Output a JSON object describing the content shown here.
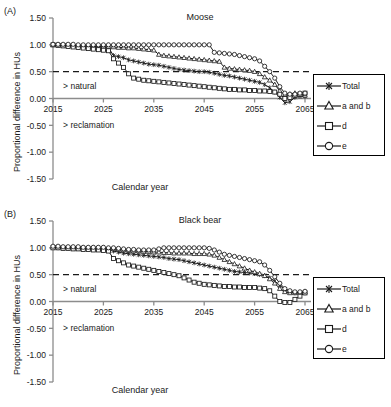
{
  "figure": {
    "background": "#ffffff",
    "axis_color": "#8c8c8c",
    "series_color": "#1a1a1a",
    "threshold_line_color": "#1a1a1a"
  },
  "panels": [
    {
      "letter": "(A)",
      "title": "Moose",
      "xlabel": "Calendar year",
      "ylabel": "Proportional difference in HUs",
      "annotation_above": "> natural",
      "annotation_below": "> reclamation"
    },
    {
      "letter": "(B)",
      "title": "Black bear",
      "xlabel": "Calendar year",
      "ylabel": "Proportional difference in HUs",
      "annotation_above": "> natural",
      "annotation_below": "> reclamation"
    }
  ],
  "legend": {
    "entries": [
      {
        "label": "Total",
        "marker": "star"
      },
      {
        "label": "a and b",
        "marker": "triangle"
      },
      {
        "label": "d",
        "marker": "square"
      },
      {
        "label": "e",
        "marker": "circle"
      }
    ]
  },
  "chart_data": [
    {
      "type": "line",
      "title": "Moose",
      "panel": "(A)",
      "xlabel": "Calendar year",
      "ylabel": "Proportional difference in HUs",
      "xlim": [
        2015,
        2065
      ],
      "ylim": [
        -1.5,
        1.5
      ],
      "xticks": [
        2015,
        2025,
        2035,
        2045,
        2055,
        2065
      ],
      "yticks": [
        -1.5,
        -1.0,
        -0.5,
        0.0,
        0.5,
        1.0,
        1.5
      ],
      "ytick_labels": [
        "-1.50",
        "-1.00",
        "-0.50",
        "0.00",
        "0.50",
        "1.00",
        "1.50"
      ],
      "grid": false,
      "legend_position": "right-outside",
      "reference_lines": [
        {
          "y": 0.5,
          "style": "dashed",
          "label": ""
        },
        {
          "y": 0.0,
          "style": "solid",
          "label": "zero axis"
        }
      ],
      "annotations": [
        {
          "text": "> natural",
          "x": 2017,
          "y": 0.18
        },
        {
          "text": "> reclamation",
          "x": 2017,
          "y": -0.55
        }
      ],
      "x": [
        2015,
        2016,
        2017,
        2018,
        2019,
        2020,
        2021,
        2022,
        2023,
        2024,
        2025,
        2026,
        2027,
        2028,
        2029,
        2030,
        2031,
        2032,
        2033,
        2034,
        2035,
        2036,
        2037,
        2038,
        2039,
        2040,
        2041,
        2042,
        2043,
        2044,
        2045,
        2046,
        2047,
        2048,
        2049,
        2050,
        2051,
        2052,
        2053,
        2054,
        2055,
        2056,
        2057,
        2058,
        2059,
        2060,
        2061,
        2062,
        2063,
        2064,
        2065
      ],
      "series": [
        {
          "name": "Total",
          "marker": "star",
          "values": [
            1.0,
            1.0,
            0.99,
            0.99,
            0.98,
            0.98,
            0.97,
            0.97,
            0.96,
            0.96,
            0.95,
            0.95,
            0.8,
            0.78,
            0.76,
            0.72,
            0.7,
            0.68,
            0.66,
            0.64,
            0.63,
            0.62,
            0.6,
            0.58,
            0.56,
            0.54,
            0.53,
            0.52,
            0.51,
            0.5,
            0.5,
            0.49,
            0.47,
            0.45,
            0.43,
            0.42,
            0.4,
            0.38,
            0.36,
            0.34,
            0.32,
            0.3,
            0.26,
            0.2,
            0.12,
            0.02,
            -0.08,
            -0.06,
            0.02,
            0.04,
            0.04
          ]
        },
        {
          "name": "a and b",
          "marker": "triangle",
          "values": [
            1.0,
            1.0,
            0.99,
            0.99,
            0.99,
            0.98,
            0.98,
            0.98,
            0.97,
            0.97,
            0.97,
            0.96,
            0.96,
            0.95,
            0.95,
            0.94,
            0.94,
            0.93,
            0.92,
            0.91,
            0.9,
            0.82,
            0.8,
            0.79,
            0.78,
            0.77,
            0.76,
            0.75,
            0.74,
            0.73,
            0.72,
            0.71,
            0.7,
            0.69,
            0.58,
            0.56,
            0.55,
            0.54,
            0.53,
            0.52,
            0.5,
            0.46,
            0.4,
            0.34,
            0.26,
            0.14,
            0.06,
            0.08,
            0.1,
            0.08,
            0.06
          ]
        },
        {
          "name": "d",
          "marker": "square",
          "values": [
            1.0,
            0.99,
            0.98,
            0.97,
            0.96,
            0.95,
            0.94,
            0.93,
            0.92,
            0.91,
            0.9,
            0.89,
            0.74,
            0.66,
            0.58,
            0.46,
            0.38,
            0.36,
            0.34,
            0.33,
            0.32,
            0.31,
            0.3,
            0.29,
            0.28,
            0.27,
            0.26,
            0.25,
            0.24,
            0.23,
            0.22,
            0.21,
            0.2,
            0.19,
            0.18,
            0.17,
            0.17,
            0.16,
            0.16,
            0.15,
            0.15,
            0.14,
            0.14,
            0.13,
            0.12,
            0.08,
            0.0,
            0.02,
            0.06,
            0.08,
            0.1
          ]
        },
        {
          "name": "e",
          "marker": "circle",
          "values": [
            1.01,
            1.01,
            1.01,
            1.01,
            1.01,
            1.0,
            1.0,
            1.0,
            1.0,
            1.0,
            1.0,
            1.0,
            1.0,
            1.0,
            1.0,
            1.0,
            1.0,
            1.0,
            1.0,
            1.0,
            1.0,
            1.0,
            1.0,
            1.0,
            1.0,
            1.0,
            1.0,
            1.0,
            1.0,
            1.0,
            1.0,
            1.0,
            0.86,
            0.85,
            0.84,
            0.83,
            0.82,
            0.8,
            0.78,
            0.76,
            0.74,
            0.7,
            0.6,
            0.5,
            0.38,
            0.22,
            0.1,
            0.08,
            0.08,
            0.1,
            0.1
          ]
        }
      ]
    },
    {
      "type": "line",
      "title": "Black bear",
      "panel": "(B)",
      "xlabel": "Calendar year",
      "ylabel": "Proportional difference in HUs",
      "xlim": [
        2015,
        2065
      ],
      "ylim": [
        -1.5,
        1.5
      ],
      "xticks": [
        2015,
        2025,
        2035,
        2045,
        2055,
        2065
      ],
      "yticks": [
        -1.5,
        -1.0,
        -0.5,
        0.0,
        0.5,
        1.0,
        1.5
      ],
      "ytick_labels": [
        "-1.50",
        "-1.00",
        "-0.50",
        "0.00",
        "0.50",
        "1.00",
        "1.50"
      ],
      "grid": false,
      "legend_position": "right-outside",
      "reference_lines": [
        {
          "y": 0.5,
          "style": "dashed",
          "label": ""
        },
        {
          "y": 0.0,
          "style": "solid",
          "label": "zero axis"
        }
      ],
      "annotations": [
        {
          "text": "> natural",
          "x": 2017,
          "y": 0.18
        },
        {
          "text": "> reclamation",
          "x": 2017,
          "y": -0.55
        }
      ],
      "x": [
        2015,
        2016,
        2017,
        2018,
        2019,
        2020,
        2021,
        2022,
        2023,
        2024,
        2025,
        2026,
        2027,
        2028,
        2029,
        2030,
        2031,
        2032,
        2033,
        2034,
        2035,
        2036,
        2037,
        2038,
        2039,
        2040,
        2041,
        2042,
        2043,
        2044,
        2045,
        2046,
        2047,
        2048,
        2049,
        2050,
        2051,
        2052,
        2053,
        2054,
        2055,
        2056,
        2057,
        2058,
        2059,
        2060,
        2061,
        2062,
        2063,
        2064,
        2065
      ],
      "series": [
        {
          "name": "Total",
          "marker": "star",
          "values": [
            1.01,
            1.0,
            1.0,
            1.0,
            0.99,
            0.99,
            0.99,
            0.99,
            0.98,
            0.98,
            0.98,
            0.97,
            0.94,
            0.92,
            0.9,
            0.89,
            0.88,
            0.87,
            0.86,
            0.85,
            0.84,
            0.83,
            0.82,
            0.8,
            0.79,
            0.78,
            0.76,
            0.74,
            0.72,
            0.7,
            0.68,
            0.66,
            0.64,
            0.62,
            0.6,
            0.58,
            0.56,
            0.55,
            0.54,
            0.53,
            0.52,
            0.5,
            0.48,
            0.44,
            0.38,
            0.3,
            0.22,
            0.18,
            0.16,
            0.16,
            0.16
          ]
        },
        {
          "name": "a and b",
          "marker": "triangle",
          "values": [
            1.02,
            1.02,
            1.01,
            1.01,
            1.01,
            1.01,
            1.0,
            1.0,
            1.0,
            1.0,
            1.0,
            0.99,
            0.98,
            0.97,
            0.96,
            0.95,
            0.94,
            0.94,
            0.93,
            0.93,
            0.92,
            0.92,
            0.91,
            0.91,
            0.9,
            0.9,
            0.9,
            0.9,
            0.89,
            0.89,
            0.89,
            0.88,
            0.86,
            0.82,
            0.78,
            0.74,
            0.7,
            0.66,
            0.62,
            0.58,
            0.55,
            0.52,
            0.48,
            0.42,
            0.34,
            0.24,
            0.18,
            0.16,
            0.16,
            0.17,
            0.18
          ]
        },
        {
          "name": "d",
          "marker": "square",
          "values": [
            1.0,
            1.0,
            0.99,
            0.99,
            0.98,
            0.98,
            0.97,
            0.97,
            0.96,
            0.96,
            0.95,
            0.94,
            0.8,
            0.76,
            0.72,
            0.68,
            0.66,
            0.64,
            0.62,
            0.6,
            0.58,
            0.56,
            0.54,
            0.52,
            0.5,
            0.48,
            0.44,
            0.4,
            0.36,
            0.34,
            0.32,
            0.31,
            0.3,
            0.29,
            0.28,
            0.28,
            0.27,
            0.27,
            0.26,
            0.26,
            0.26,
            0.25,
            0.24,
            0.2,
            0.1,
            0.0,
            -0.02,
            -0.02,
            0.04,
            0.1,
            0.16
          ]
        },
        {
          "name": "e",
          "marker": "circle",
          "values": [
            1.03,
            1.03,
            1.02,
            1.02,
            1.02,
            1.02,
            1.01,
            1.01,
            1.01,
            1.01,
            1.01,
            1.0,
            1.0,
            0.99,
            0.98,
            0.97,
            0.97,
            0.96,
            0.96,
            0.96,
            0.96,
            0.98,
            1.0,
            1.0,
            1.0,
            1.0,
            1.0,
            1.0,
            1.0,
            1.0,
            1.0,
            0.99,
            0.96,
            0.92,
            0.88,
            0.86,
            0.84,
            0.82,
            0.8,
            0.78,
            0.76,
            0.74,
            0.68,
            0.58,
            0.46,
            0.34,
            0.24,
            0.2,
            0.18,
            0.18,
            0.19
          ]
        }
      ]
    }
  ]
}
